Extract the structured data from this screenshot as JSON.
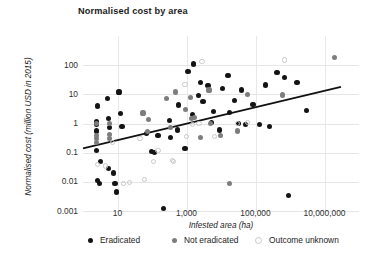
{
  "chart_data": {
    "type": "scatter",
    "title": "Normalised cost by area",
    "xlabel": "Infested area (ha)",
    "ylabel": "Normalised cost (million USD in 2015)",
    "xscale": "log",
    "yscale": "log",
    "xlim": [
      1,
      100000000
    ],
    "ylim": [
      0.001,
      1000
    ],
    "grid": true,
    "legend_position": "bottom",
    "xticks": [
      10,
      1000,
      100000,
      10000000
    ],
    "xtick_labels": [
      "10",
      "1,000",
      "100,000",
      "10,000,000"
    ],
    "yticks": [
      100,
      10,
      1,
      0.1,
      0.01,
      0.001
    ],
    "ytick_labels": [
      "100",
      "10",
      "1",
      "0.1",
      "0.01",
      "0.001"
    ],
    "colors": {
      "eradicated": "#141414",
      "not_eradicated": "#7d7d7d",
      "outcome_unknown": "#c9c9c9",
      "trendline": "#111111",
      "gridline": "#e6e6e6"
    },
    "series": [
      {
        "name": "Eradicated",
        "key": "eradicated",
        "color": "#141414",
        "points": [
          [
            2.6,
            4.0
          ],
          [
            5.0,
            7.0
          ],
          [
            11.0,
            12.0
          ],
          [
            2.4,
            1.2
          ],
          [
            2.4,
            0.9
          ],
          [
            2.4,
            0.55
          ],
          [
            2.5,
            0.12
          ],
          [
            5.6,
            1.5
          ],
          [
            6.0,
            0.75
          ],
          [
            12.0,
            2.2
          ],
          [
            13.5,
            0.8
          ],
          [
            3.3,
            0.05
          ],
          [
            5.5,
            0.028
          ],
          [
            3.0,
            0.009
          ],
          [
            8.5,
            0.009
          ],
          [
            9.5,
            0.0045
          ],
          [
            2.7,
            0.011
          ],
          [
            7.6,
            0.02
          ],
          [
            95.0,
            0.11
          ],
          [
            120.0,
            0.1
          ],
          [
            210.0,
            0.0012
          ],
          [
            330.0,
            1.3
          ],
          [
            340.0,
            0.33
          ],
          [
            560.0,
            0.6
          ],
          [
            600.0,
            4.3
          ],
          [
            1100.0,
            60.0
          ],
          [
            1500.0,
            2.0
          ],
          [
            1600.0,
            110.0
          ],
          [
            2200.0,
            9.0
          ],
          [
            2500.0,
            25.0
          ],
          [
            3000.0,
            5.5
          ],
          [
            4200.0,
            20.0
          ],
          [
            5200.0,
            1.1
          ],
          [
            6000.0,
            2.6
          ],
          [
            9000.0,
            0.6
          ],
          [
            11000.0,
            16.0
          ],
          [
            16000.0,
            45.0
          ],
          [
            18000.0,
            2.4
          ],
          [
            24000.0,
            6.0
          ],
          [
            33000.0,
            1.0
          ],
          [
            40000.0,
            14.0
          ],
          [
            52000.0,
            0.9
          ],
          [
            85000.0,
            4.5
          ],
          [
            130000.0,
            0.9
          ],
          [
            200000.0,
            21.0
          ],
          [
            260000.0,
            0.8
          ],
          [
            420000.0,
            55.0
          ],
          [
            700000.0,
            38.0
          ],
          [
            900000.0,
            0.0035
          ],
          [
            1600000.0,
            25.0
          ],
          [
            3000000.0,
            2.8
          ],
          [
            70.0,
            0.45
          ],
          [
            150.0,
            0.4
          ],
          [
            900.0,
            0.14
          ]
        ]
      },
      {
        "name": "Not eradicated",
        "key": "not_eradicated",
        "color": "#7d7d7d",
        "points": [
          [
            2.4,
            1.0
          ],
          [
            2.4,
            0.38
          ],
          [
            2.4,
            0.3
          ],
          [
            2.4,
            0.22
          ],
          [
            6.0,
            1.0
          ],
          [
            6.0,
            0.42
          ],
          [
            6.0,
            0.3
          ],
          [
            55.0,
            2.3
          ],
          [
            80.0,
            1.4
          ],
          [
            75.0,
            0.52
          ],
          [
            480.0,
            12.0
          ],
          [
            950.0,
            3.0
          ],
          [
            1300.0,
            8.0
          ],
          [
            1400.0,
            1.5
          ],
          [
            1700.0,
            1.6
          ],
          [
            2600.0,
            0.33
          ],
          [
            4500.0,
            14.0
          ],
          [
            9500.0,
            0.4
          ],
          [
            18000.0,
            0.009
          ],
          [
            30000.0,
            0.55
          ],
          [
            60000.0,
            10.0
          ],
          [
            600000.0,
            9.5
          ],
          [
            20000000.0,
            180.0
          ],
          [
            260.0,
            7.0
          ],
          [
            340.0,
            0.75
          ],
          [
            5000.0,
            1.0
          ]
        ]
      },
      {
        "name": "Outcome unknown",
        "key": "outcome_unknown",
        "color": "#c9c9c9",
        "points": [
          [
            2.6,
            0.04
          ],
          [
            4.5,
            0.035
          ],
          [
            15.0,
            0.009
          ],
          [
            22.0,
            0.0095
          ],
          [
            60.0,
            0.012
          ],
          [
            110.0,
            0.05
          ],
          [
            150.0,
            0.12
          ],
          [
            400.0,
            0.055
          ],
          [
            420.0,
            0.05
          ],
          [
            900.0,
            22.0
          ],
          [
            1000.0,
            0.35
          ],
          [
            1500.0,
            0.9
          ],
          [
            2300.0,
            1.0
          ],
          [
            2800.0,
            130.0
          ],
          [
            6500.0,
            0.35
          ],
          [
            30000.0,
            1.0
          ],
          [
            60000.0,
            1.1
          ],
          [
            700000.0,
            150.0
          ],
          [
            7.0,
            0.22
          ],
          [
            45.0,
            0.3
          ]
        ]
      }
    ],
    "trendline": {
      "label": "linear fit (log-log)",
      "x_start": 1.0,
      "y_start": 0.14,
      "x_end": 30000000.0,
      "y_end": 18.0
    }
  }
}
